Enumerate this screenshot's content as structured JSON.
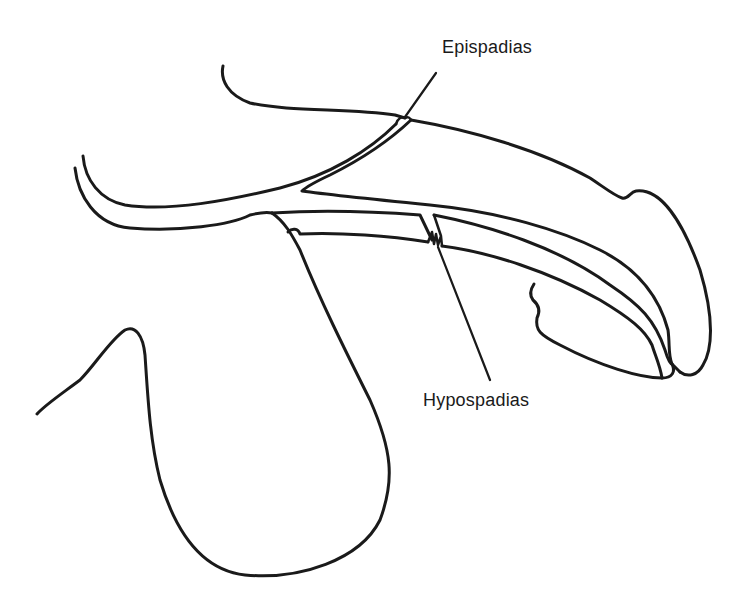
{
  "diagram": {
    "labels": [
      {
        "id": "epispadias",
        "text": "Epispadias"
      },
      {
        "id": "hypospadias",
        "text": "Hypospadias"
      }
    ],
    "colors": {
      "stroke": "#1a1a1a",
      "background": "#ffffff"
    }
  }
}
